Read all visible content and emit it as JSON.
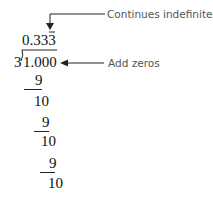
{
  "annotations": {
    "repeat": "Continues indefinitely",
    "zeros": "Add zeros"
  },
  "division": {
    "quotient": "0.333",
    "divisor": "3",
    "dividend": "1.000",
    "steps": [
      {
        "subtract": "9",
        "remainder": "10"
      },
      {
        "subtract": "9",
        "remainder": "10"
      },
      {
        "subtract": "9",
        "remainder": "10"
      }
    ]
  }
}
